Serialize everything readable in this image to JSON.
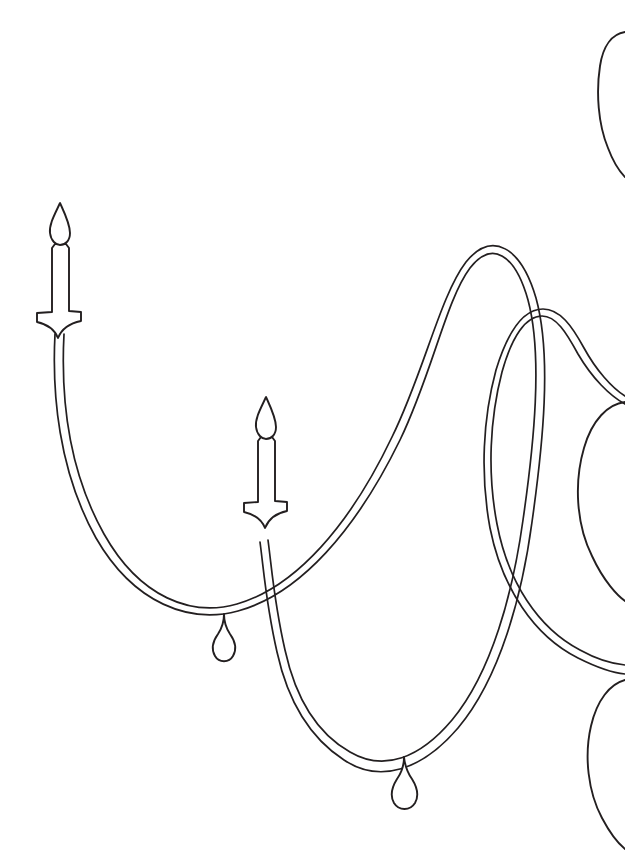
{
  "artwork": {
    "title": "Candle Garland Line Drawing",
    "kind": "line-art",
    "background_color": "#ffffff",
    "stroke_color": "#231f20",
    "canvas": {
      "width": 625,
      "height": 856
    },
    "description": "Black outline drawing of a draped double-stranded garland carrying lit candles and teardrop pendants, with partial leaf loops cropped at the right edge."
  },
  "elements": {
    "candles": [
      {
        "id": "candle-left",
        "label": "Left candle",
        "flame_tip": {
          "x": 65,
          "y": 202
        },
        "base_center": {
          "x": 60,
          "y": 330
        },
        "height": 128
      },
      {
        "id": "candle-middle",
        "label": "Middle candle",
        "flame_tip": {
          "x": 271,
          "y": 396
        },
        "base_center": {
          "x": 266,
          "y": 520
        },
        "height": 124
      }
    ],
    "pendants": [
      {
        "id": "pendant-left",
        "label": "Left teardrop pendant",
        "anchor": {
          "x": 224,
          "y": 617
        },
        "bulb_center": {
          "x": 224,
          "y": 647
        },
        "width": 20,
        "height": 36
      },
      {
        "id": "pendant-right",
        "label": "Right teardrop pendant",
        "anchor": {
          "x": 404,
          "y": 760
        },
        "bulb_center": {
          "x": 404,
          "y": 790
        },
        "width": 22,
        "height": 38
      }
    ],
    "swags": [
      {
        "id": "swag-main",
        "label": "Main S-curve garland strand",
        "strand_count": 2,
        "low_points": [
          {
            "x": 224,
            "y": 612
          },
          {
            "x": 404,
            "y": 757
          }
        ],
        "high_points": [
          {
            "x": 65,
            "y": 330
          },
          {
            "x": 470,
            "y": 256
          }
        ]
      },
      {
        "id": "swag-secondary",
        "label": "Secondary garland strand crossing at right",
        "strand_count": 2,
        "low_points": [
          {
            "x": 560,
            "y": 470
          }
        ],
        "high_points": [
          {
            "x": 540,
            "y": 322
          }
        ]
      }
    ],
    "leaves": [
      {
        "id": "leaf-top-right",
        "label": "Top right cropped leaf loop",
        "bbox": {
          "x": 596,
          "y": 28,
          "w": 29,
          "h": 160
        }
      },
      {
        "id": "leaf-mid-right",
        "label": "Middle right cropped leaf loop",
        "bbox": {
          "x": 580,
          "y": 400,
          "w": 45,
          "h": 235
        }
      },
      {
        "id": "leaf-bottom-right",
        "label": "Bottom right cropped leaf loop",
        "bbox": {
          "x": 588,
          "y": 676,
          "w": 37,
          "h": 180
        }
      }
    ]
  }
}
